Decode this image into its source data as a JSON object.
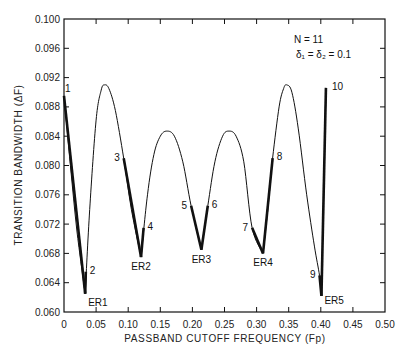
{
  "chart_data": {
    "type": "line",
    "title": "",
    "xlabel": "PASSBAND CUTOFF FREQUENCY (Fp)",
    "ylabel": "TRANSITION BANDWIDTH (ΔF)",
    "xlim": [
      0,
      0.5
    ],
    "ylim": [
      0.06,
      0.1
    ],
    "grid": false,
    "x_ticks": [
      "0",
      "0.05",
      "0.10",
      "0.15",
      "0.20",
      "0.25",
      "0.30",
      "0.35",
      "0.40",
      "0.45",
      "0.50"
    ],
    "x_tick_values": [
      0,
      0.05,
      0.1,
      0.15,
      0.2,
      0.25,
      0.3,
      0.35,
      0.4,
      0.45,
      0.5
    ],
    "y_ticks": [
      "0.060",
      "0.064",
      "0.068",
      "0.072",
      "0.076",
      "0.080",
      "0.084",
      "0.088",
      "0.092",
      "0.096",
      "0.100"
    ],
    "y_tick_values": [
      0.06,
      0.064,
      0.068,
      0.072,
      0.076,
      0.08,
      0.084,
      0.088,
      0.092,
      0.096,
      0.1
    ],
    "annotations_text": [
      "N = 11",
      "δ1 = δ2 = 0.1"
    ],
    "series": [
      {
        "name": "transition bandwidth curve",
        "x": [
          0.0,
          0.01,
          0.02,
          0.033,
          0.04,
          0.05,
          0.058,
          0.063,
          0.07,
          0.08,
          0.093,
          0.105,
          0.12,
          0.13,
          0.14,
          0.15,
          0.16,
          0.172,
          0.185,
          0.198,
          0.214,
          0.224,
          0.235,
          0.247,
          0.257,
          0.268,
          0.28,
          0.293,
          0.31,
          0.318,
          0.325,
          0.335,
          0.342,
          0.347,
          0.355,
          0.365,
          0.378,
          0.39,
          0.398,
          0.401,
          0.408
        ],
        "y": [
          0.0895,
          0.08,
          0.0712,
          0.0625,
          0.074,
          0.0862,
          0.0903,
          0.091,
          0.0905,
          0.0875,
          0.081,
          0.074,
          0.0675,
          0.076,
          0.0815,
          0.084,
          0.0847,
          0.084,
          0.0805,
          0.0745,
          0.0685,
          0.0745,
          0.0805,
          0.084,
          0.0847,
          0.084,
          0.0805,
          0.0715,
          0.068,
          0.0745,
          0.081,
          0.088,
          0.0905,
          0.091,
          0.09,
          0.085,
          0.076,
          0.069,
          0.065,
          0.0622,
          0.0906
        ]
      }
    ],
    "bold_segments": [
      {
        "from_point": "1",
        "to_point": "ER1"
      },
      {
        "from_point": "ER1",
        "to_point": "2"
      },
      {
        "from_point": "3",
        "to_point": "ER2"
      },
      {
        "from_point": "ER2",
        "to_point": "4"
      },
      {
        "from_point": "5",
        "to_point": "ER3"
      },
      {
        "from_point": "ER3",
        "to_point": "6"
      },
      {
        "from_point": "7",
        "to_point": "ER4"
      },
      {
        "from_point": "ER4",
        "to_point": "8"
      },
      {
        "from_point": "9",
        "to_point": "ER5"
      },
      {
        "from_point": "ER5",
        "to_point": "10"
      }
    ],
    "labeled_points": [
      {
        "label": "1",
        "x": 0.0,
        "y": 0.0895
      },
      {
        "label": "2",
        "x": 0.034,
        "y": 0.0655
      },
      {
        "label": "3",
        "x": 0.093,
        "y": 0.081
      },
      {
        "label": "4",
        "x": 0.124,
        "y": 0.0715
      },
      {
        "label": "5",
        "x": 0.198,
        "y": 0.0745
      },
      {
        "label": "6",
        "x": 0.224,
        "y": 0.0745
      },
      {
        "label": "7",
        "x": 0.293,
        "y": 0.0715
      },
      {
        "label": "8",
        "x": 0.325,
        "y": 0.081
      },
      {
        "label": "9",
        "x": 0.398,
        "y": 0.065
      },
      {
        "label": "10",
        "x": 0.408,
        "y": 0.0906
      }
    ],
    "extremal_points": [
      {
        "label": "ER1",
        "x": 0.033,
        "y": 0.0625
      },
      {
        "label": "ER2",
        "x": 0.12,
        "y": 0.0675
      },
      {
        "label": "ER3",
        "x": 0.214,
        "y": 0.0685
      },
      {
        "label": "ER4",
        "x": 0.31,
        "y": 0.068
      },
      {
        "label": "ER5",
        "x": 0.401,
        "y": 0.0622
      }
    ],
    "peaks": [
      {
        "x": 0.063,
        "y": 0.091
      },
      {
        "x": 0.16,
        "y": 0.0847
      },
      {
        "x": 0.257,
        "y": 0.0847
      },
      {
        "x": 0.347,
        "y": 0.091
      }
    ]
  },
  "legend": {
    "n_label": "N = 11",
    "delta_label": "δ₁ = δ₂ = 0.1"
  }
}
